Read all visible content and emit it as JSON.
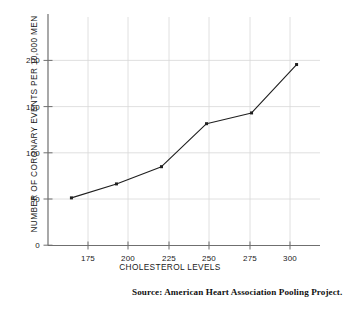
{
  "chart_data": {
    "type": "line",
    "title": "",
    "xlabel": "CHOLESTEROL LEVELS",
    "ylabel": "NUMBER OF CORONARY EVENTS PER 10,000 MEN",
    "x": [
      175,
      200,
      225,
      250,
      275,
      300
    ],
    "values": [
      44,
      57,
      73,
      113,
      123,
      168
    ],
    "series": [
      {
        "name": "Coronary events per 10,000 men",
        "values": [
          44,
          57,
          73,
          113,
          123,
          168
        ]
      }
    ],
    "xtick_labels": [
      "175",
      "200",
      "225",
      "250",
      "275",
      "300"
    ],
    "ytick_labels": [
      "0",
      "50",
      "100",
      "150",
      "200"
    ],
    "yticks": [
      0,
      50,
      100,
      150,
      200
    ],
    "xlim": [
      162,
      313
    ],
    "ylim": [
      0,
      215
    ],
    "grid": true,
    "grid_color": "#d8d8d8",
    "line_color": "#1f1f1f",
    "marker": "square",
    "marker_color": "#1f1f1f",
    "legend": "none"
  },
  "caption": {
    "source_text": "Source: American Heart Association Pooling Project."
  },
  "colors": {
    "background": "#ffffff",
    "axis": "#6f6f6f",
    "text": "#1a1a1a",
    "grid": "#d8d8d8",
    "data": "#1f1f1f"
  }
}
